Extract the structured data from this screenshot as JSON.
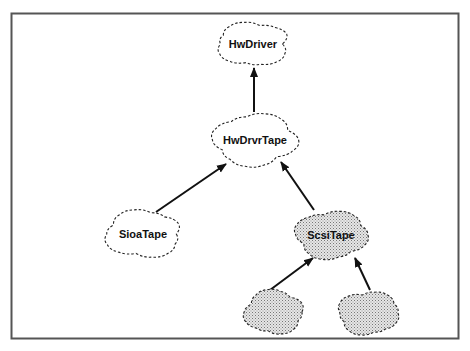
{
  "diagram": {
    "title": "",
    "nodes": [
      {
        "id": "hwdriver",
        "label": "HwDriver",
        "shaded": false
      },
      {
        "id": "hwdrvrtape",
        "label": "HwDrvrTape",
        "shaded": false
      },
      {
        "id": "sioatape",
        "label": "SioaTape",
        "shaded": false
      },
      {
        "id": "scsitape",
        "label": "ScsiTape",
        "shaded": true
      },
      {
        "id": "sub1",
        "label": "",
        "shaded": true
      },
      {
        "id": "sub2",
        "label": "",
        "shaded": true
      }
    ],
    "edges": [
      {
        "from": "hwdrvrtape",
        "to": "hwdriver"
      },
      {
        "from": "sioatape",
        "to": "hwdrvrtape"
      },
      {
        "from": "scsitape",
        "to": "hwdrvrtape"
      },
      {
        "from": "sub1",
        "to": "scsitape"
      },
      {
        "from": "sub2",
        "to": "scsitape"
      }
    ],
    "colors": {
      "line": "#111111",
      "shade": "#cfcfcf",
      "frame": "#555555"
    }
  }
}
